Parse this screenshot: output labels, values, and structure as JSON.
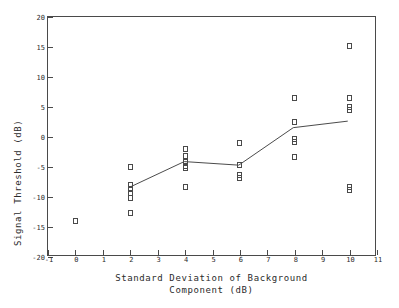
{
  "chart_data": {
    "type": "scatter",
    "title": "",
    "xlabel": "Standard Deviation of Background Component (dB)",
    "ylabel": "Signal Threshold (dB)",
    "xlim": [
      -1,
      11
    ],
    "ylim": [
      -20,
      20
    ],
    "xticks": [
      -1,
      0,
      1,
      2,
      3,
      4,
      5,
      6,
      7,
      8,
      9,
      10,
      11
    ],
    "yticks": [
      -20,
      -15,
      -10,
      -5,
      0,
      5,
      10,
      15,
      20
    ],
    "xtick_labels": [
      "-1",
      "0",
      "1",
      "2",
      "3",
      "4",
      "5",
      "6",
      "7",
      "8",
      "9",
      "10",
      "11"
    ],
    "ytick_labels": [
      "-20",
      "-15",
      "-10",
      "-5",
      "0",
      "5",
      "10",
      "15",
      "20"
    ],
    "grid": false,
    "legend": null,
    "marker_style": "open-square",
    "series": [
      {
        "name": "individual observations",
        "type": "scatter",
        "points": [
          [
            0,
            -14.0
          ],
          [
            2,
            -5.0
          ],
          [
            2,
            -8.0
          ],
          [
            2,
            -8.7
          ],
          [
            2,
            -9.3
          ],
          [
            2,
            -10.2
          ],
          [
            2,
            -12.7
          ],
          [
            4,
            -2.0
          ],
          [
            4,
            -3.2
          ],
          [
            4,
            -4.2
          ],
          [
            4,
            -4.9
          ],
          [
            4,
            -5.2
          ],
          [
            4,
            -8.3
          ],
          [
            6,
            -1.0
          ],
          [
            6,
            -4.7
          ],
          [
            6,
            -6.4
          ],
          [
            6,
            -6.9
          ],
          [
            8,
            6.5
          ],
          [
            8,
            2.5
          ],
          [
            8,
            -0.3
          ],
          [
            8,
            -0.9
          ],
          [
            8,
            -3.3
          ],
          [
            10,
            15.1
          ],
          [
            10,
            6.5
          ],
          [
            10,
            5.0
          ],
          [
            10,
            4.5
          ],
          [
            10,
            -8.3
          ],
          [
            10,
            -8.8
          ]
        ]
      },
      {
        "name": "mean trend",
        "type": "line",
        "x": [
          2,
          4,
          6,
          8,
          10
        ],
        "values": [
          -8.6,
          -4.3,
          -4.9,
          1.4,
          2.5
        ]
      }
    ]
  },
  "axis": {
    "ylabel_text": "Signal Threshold (dB)",
    "xlabel_line1": "Standard Deviation of Background",
    "xlabel_line2": "Component (dB)"
  },
  "style": {
    "line_color": "#4a4a4a",
    "marker_color": "#4a4a4a",
    "background": "#ffffff",
    "text_color": "#2b2b2b"
  }
}
